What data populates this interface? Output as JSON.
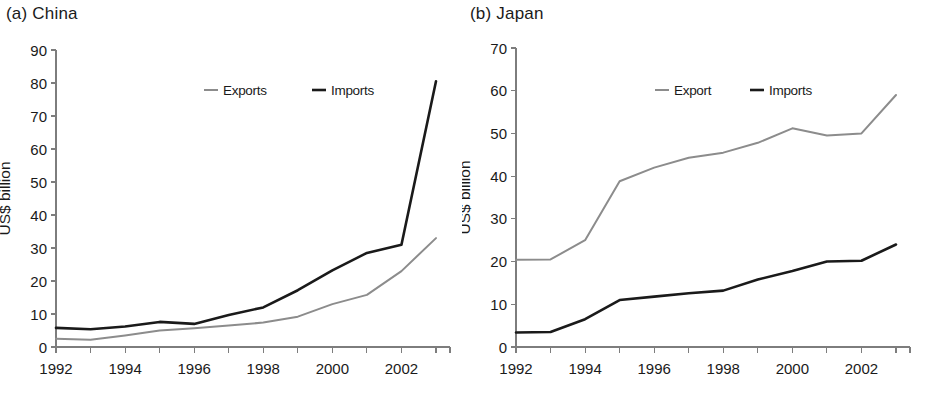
{
  "figure": {
    "panels": [
      {
        "id": "china",
        "title": "(a)  China",
        "ylabel": "US$ billion"
      },
      {
        "id": "japan",
        "title": "(b)  Japan",
        "ylabel": "US$ billion"
      }
    ]
  },
  "colors": {
    "exports_line": "#8c8c8c",
    "imports_line": "#1a1a1a",
    "axis": "#7d7d7d",
    "text": "#1a1a1a",
    "background": "#ffffff"
  },
  "chart_data": [
    {
      "type": "line",
      "title": "(a)  China",
      "xlabel": "",
      "ylabel": "US$ billion",
      "x": [
        1992,
        1993,
        1994,
        1995,
        1996,
        1997,
        1998,
        1999,
        2000,
        2001,
        2002,
        2003
      ],
      "xtick_labels": [
        "1992",
        "",
        "1994",
        "",
        "1996",
        "",
        "1998",
        "",
        "2000",
        "",
        "2002",
        ""
      ],
      "xlim": [
        1992,
        2003
      ],
      "ylim": [
        0,
        90
      ],
      "yticks": [
        0,
        10,
        20,
        30,
        40,
        50,
        60,
        70,
        80,
        90
      ],
      "grid": false,
      "legend_position": "top-center",
      "series": [
        {
          "name": "Exports",
          "color": "#8c8c8c",
          "values": [
            2.5,
            2.2,
            3.5,
            5.0,
            5.7,
            6.5,
            7.4,
            9.2,
            13.0,
            15.8,
            23.0,
            33.0
          ]
        },
        {
          "name": "Imports",
          "color": "#1a1a1a",
          "values": [
            5.8,
            5.4,
            6.2,
            7.6,
            7.0,
            9.7,
            12.0,
            17.2,
            23.2,
            28.5,
            31.0,
            80.5
          ]
        }
      ]
    },
    {
      "type": "line",
      "title": "(b)  Japan",
      "xlabel": "",
      "ylabel": "US$ billion",
      "x": [
        1992,
        1993,
        1994,
        1995,
        1996,
        1997,
        1998,
        1999,
        2000,
        2001,
        2002,
        2003
      ],
      "xtick_labels": [
        "1992",
        "",
        "1994",
        "",
        "1996",
        "",
        "1998",
        "",
        "2000",
        "",
        "2002",
        ""
      ],
      "xlim": [
        1992,
        2003
      ],
      "ylim": [
        0,
        70
      ],
      "yticks": [
        0,
        10,
        20,
        30,
        40,
        50,
        60,
        70
      ],
      "grid": false,
      "legend_position": "top-center",
      "series": [
        {
          "name": "Export",
          "color": "#8c8c8c",
          "values": [
            20.4,
            20.5,
            25.0,
            38.8,
            42.0,
            44.3,
            45.5,
            47.8,
            51.2,
            49.5,
            50.0,
            59.0
          ]
        },
        {
          "name": "Imports",
          "color": "#1a1a1a",
          "values": [
            3.4,
            3.5,
            6.5,
            11.0,
            11.8,
            12.6,
            13.2,
            15.8,
            17.8,
            20.0,
            20.2,
            24.0
          ]
        }
      ]
    }
  ]
}
